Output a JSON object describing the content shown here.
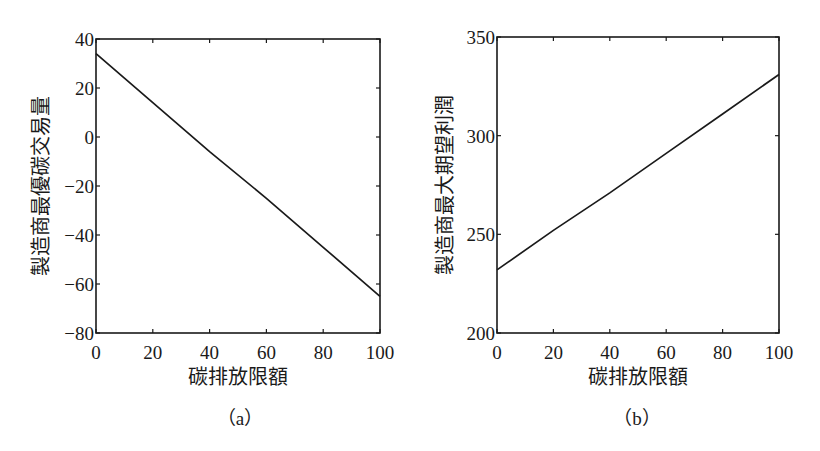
{
  "chart_data": [
    {
      "id": "a",
      "type": "line",
      "caption": "（a）",
      "title": "",
      "xlabel": "碳排放限額",
      "ylabel": "製造商最優碳交易量",
      "xlim": [
        0,
        100
      ],
      "ylim": [
        -80,
        40
      ],
      "xticks": [
        0,
        20,
        40,
        60,
        80,
        100
      ],
      "yticks": [
        -80,
        -60,
        -40,
        -20,
        0,
        20,
        40
      ],
      "grid": false,
      "legend": null,
      "series": [
        {
          "name": "製造商最優碳交易量",
          "x": [
            0,
            20,
            40,
            60,
            80,
            100
          ],
          "y": [
            34,
            14,
            -6,
            -25,
            -45,
            -65
          ]
        }
      ],
      "color": "#1a1a1a"
    },
    {
      "id": "b",
      "type": "line",
      "caption": "（b）",
      "title": "",
      "xlabel": "碳排放限額",
      "ylabel": "製造商最大期望利潤",
      "xlim": [
        0,
        100
      ],
      "ylim": [
        200,
        350
      ],
      "xticks": [
        0,
        20,
        40,
        60,
        80,
        100
      ],
      "yticks": [
        200,
        250,
        300,
        350
      ],
      "grid": false,
      "legend": null,
      "series": [
        {
          "name": "製造商最大期望利潤",
          "x": [
            0,
            20,
            40,
            60,
            80,
            100
          ],
          "y": [
            232,
            252,
            271,
            291,
            311,
            331
          ]
        }
      ],
      "color": "#1a1a1a"
    }
  ]
}
